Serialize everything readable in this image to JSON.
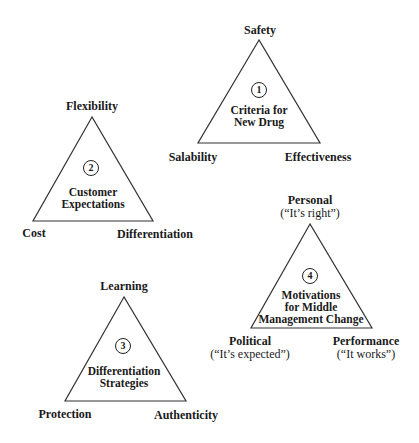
{
  "triangles": [
    {
      "number": "1",
      "title_lines": [
        "Criteria for",
        "New Drug"
      ],
      "top": "Safety",
      "left": "Salability",
      "right": "Effectiveness"
    },
    {
      "number": "2",
      "title_lines": [
        "Customer",
        "Expectations"
      ],
      "top": "Flexibility",
      "left": "Cost",
      "right": "Differentiation"
    },
    {
      "number": "3",
      "title_lines": [
        "Differentiation",
        "Strategies"
      ],
      "top": "Learning",
      "left": "Protection",
      "right": "Authenticity"
    },
    {
      "number": "4",
      "title_lines": [
        "Motivations",
        "for Middle",
        "Management Change"
      ],
      "top": "Personal",
      "top_sub": "(“It’s right”)",
      "left": "Political",
      "left_sub": "(“It’s expected”)",
      "right": "Performance",
      "right_sub": "(“It works”)"
    }
  ],
  "colors": {
    "line": "#333333",
    "text": "#1a1a1a",
    "background": "#ffffff"
  }
}
